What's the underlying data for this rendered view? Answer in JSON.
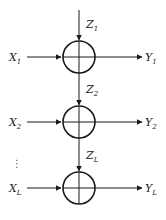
{
  "diagram": {
    "type": "adder-chain",
    "stages": [
      {
        "input": {
          "base": "X",
          "sub": "1"
        },
        "noise": {
          "base": "Z",
          "sub": "1"
        },
        "output": {
          "base": "Y",
          "sub": "1"
        },
        "cy": 57
      },
      {
        "input": {
          "base": "X",
          "sub": "2"
        },
        "noise": {
          "base": "Z",
          "sub": "2"
        },
        "output": {
          "base": "Y",
          "sub": "2"
        },
        "cy": 122
      },
      {
        "input": {
          "base": "X",
          "sub": "L"
        },
        "noise": {
          "base": "Z",
          "sub": "L"
        },
        "output": {
          "base": "Y",
          "sub": "L"
        },
        "cy": 188
      }
    ],
    "ellipsis": "⋮",
    "node_symbol": "adder-circle",
    "colors": {
      "stroke": "#1a1a1a",
      "text": "#222222",
      "background": "#ffffff"
    }
  }
}
